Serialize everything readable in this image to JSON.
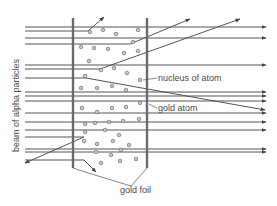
{
  "diagram": {
    "title": "",
    "labels": {
      "beam": "beam of alpha particles",
      "nucleus": "nucleus of atom",
      "gold_atom": "gold atom",
      "gold_foil": "gold foil"
    },
    "colors": {
      "line": "#555555",
      "foil": "#6a6a6a",
      "dot_fill": "#c8c8c8",
      "dot_stroke": "#6e6e6e",
      "text": "#4a4a4a"
    },
    "foil": {
      "left_x": 73,
      "right_x": 147,
      "top_y": 18,
      "bottom_y": 168
    },
    "straight_beams_y": [
      27,
      38,
      65,
      92,
      96,
      101,
      113,
      122,
      130,
      149,
      152
    ],
    "deflected_paths": [
      {
        "points": [
          [
            25,
            31
          ],
          [
            88,
            31
          ],
          [
            104,
            17
          ]
        ],
        "type": "large-deflection-up"
      },
      {
        "points": [
          [
            25,
            44
          ],
          [
            130,
            44
          ],
          [
            190,
            19
          ]
        ],
        "type": "small-deflection-up"
      },
      {
        "points": [
          [
            25,
            69
          ],
          [
            100,
            69
          ],
          [
            240,
            19
          ]
        ],
        "type": "small-deflection-up"
      },
      {
        "points": [
          [
            25,
            78
          ],
          [
            86,
            78
          ],
          [
            265,
            110
          ]
        ],
        "type": "small-deflection-down"
      },
      {
        "points": [
          [
            25,
            137
          ],
          [
            84,
            137
          ],
          [
            25,
            163
          ]
        ],
        "type": "backscatter"
      },
      {
        "points": [
          [
            25,
            160
          ],
          [
            84,
            160
          ],
          [
            96,
            172
          ]
        ],
        "type": "large-deflection-down"
      }
    ],
    "gold_atoms": [
      [
        90,
        32
      ],
      [
        103,
        30
      ],
      [
        116,
        34
      ],
      [
        138,
        30
      ],
      [
        133,
        42
      ],
      [
        81,
        47
      ],
      [
        94,
        48
      ],
      [
        108,
        49
      ],
      [
        124,
        53
      ],
      [
        138,
        51
      ],
      [
        89,
        61
      ],
      [
        101,
        70
      ],
      [
        114,
        68
      ],
      [
        127,
        73
      ],
      [
        85,
        76
      ],
      [
        140,
        80
      ],
      [
        81,
        88
      ],
      [
        97,
        88
      ],
      [
        112,
        86
      ],
      [
        126,
        90
      ],
      [
        82,
        108
      ],
      [
        97,
        112
      ],
      [
        112,
        108
      ],
      [
        126,
        107
      ],
      [
        140,
        103
      ],
      [
        85,
        124
      ],
      [
        95,
        123
      ],
      [
        109,
        122
      ],
      [
        123,
        121
      ],
      [
        139,
        119
      ],
      [
        85,
        132
      ],
      [
        105,
        130
      ],
      [
        119,
        135
      ],
      [
        84,
        141
      ],
      [
        97,
        144
      ],
      [
        113,
        141
      ],
      [
        129,
        145
      ],
      [
        96,
        152
      ],
      [
        111,
        155
      ],
      [
        121,
        150
      ],
      [
        101,
        163
      ],
      [
        120,
        161
      ],
      [
        136,
        159
      ]
    ],
    "nucleus_label_anchor": [
      140,
      80
    ],
    "gold_atom_label_anchor": [
      140,
      105
    ]
  }
}
